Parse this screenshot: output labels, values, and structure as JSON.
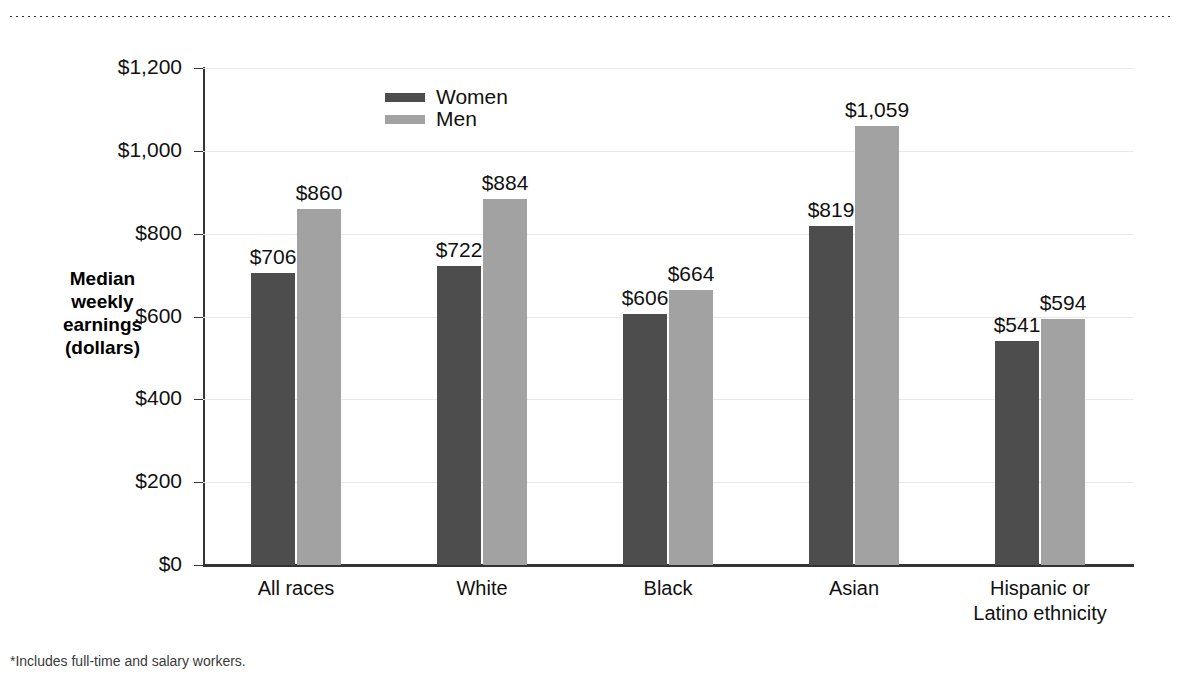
{
  "top_rule": {
    "name": "dotted-rule"
  },
  "chart_data": {
    "type": "bar",
    "title": "",
    "subtitle": "",
    "xlabel": "",
    "ylabel": "Median weekly earnings (dollars)",
    "ylabel_lines": [
      "Median",
      "weekly",
      "earnings",
      "(dollars)"
    ],
    "ylim": [
      0,
      1200
    ],
    "ytick_values": [
      0,
      200,
      400,
      600,
      800,
      1000,
      1200
    ],
    "ytick_labels": [
      "$0",
      "$200",
      "$400",
      "$600",
      "$800",
      "$1,000",
      "$1,200"
    ],
    "grid": true,
    "legend_position": "inside-top-center",
    "categories": [
      "All races",
      "White",
      "Black",
      "Asian",
      "Hispanic or Latino ethnicity"
    ],
    "category_label_lines": [
      [
        "All races"
      ],
      [
        "White"
      ],
      [
        "Black"
      ],
      [
        "Asian"
      ],
      [
        "Hispanic or",
        "Latino ethnicity"
      ]
    ],
    "series": [
      {
        "name": "Women",
        "color": "#4d4d4d",
        "values": [
          706,
          722,
          606,
          819,
          541
        ],
        "value_labels": [
          "$706",
          "$722",
          "$606",
          "$819",
          "$541"
        ]
      },
      {
        "name": "Men",
        "color": "#a2a2a2",
        "values": [
          860,
          884,
          664,
          1059,
          594
        ],
        "value_labels": [
          "$860",
          "$884",
          "$664",
          "$1,059",
          "$594"
        ]
      }
    ],
    "annotations": [
      "*Includes full-time and salary workers."
    ]
  },
  "legend": {
    "items": [
      {
        "label": "Women",
        "color": "#4d4d4d"
      },
      {
        "label": "Men",
        "color": "#a2a2a2"
      }
    ]
  },
  "footnote": {
    "text": "*Includes full-time and salary workers."
  },
  "colors": {
    "women": "#4d4d4d",
    "men": "#a2a2a2",
    "axis": "#343434",
    "grid": "#e8e8e8",
    "text": "#111111",
    "background": "#ffffff"
  }
}
